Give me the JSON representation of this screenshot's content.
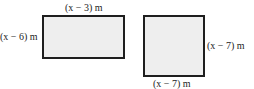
{
  "figures": [
    {
      "name": "rectangle",
      "top_label": "(x − 3) m",
      "side_label": "(x − 6) m"
    },
    {
      "name": "square",
      "side_label": "(x − 7) m",
      "bottom_label": "(x − 7) m"
    }
  ],
  "colors": {
    "fill": "#eeeeee",
    "stroke": "#1e1e1e",
    "text": "#222222"
  }
}
